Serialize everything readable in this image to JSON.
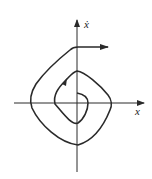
{
  "diagram": {
    "type": "phase-portrait",
    "axes": {
      "x_label": "x",
      "y_label": "ẋ"
    },
    "colors": {
      "stroke": "#2a2a2a",
      "background": "#ffffff"
    }
  }
}
